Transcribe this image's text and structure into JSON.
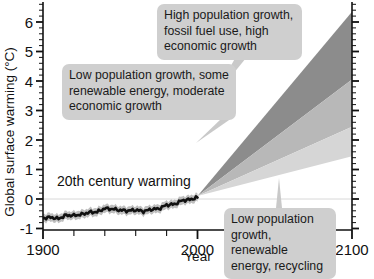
{
  "chart_data": {
    "type": "area",
    "title": "",
    "xlabel": "Year",
    "ylabel": "Global surface warming (°C)",
    "xlim": [
      1900,
      2100
    ],
    "ylim": [
      -1.2,
      6.6
    ],
    "xticks": [
      1900,
      2000,
      2100
    ],
    "xtick_labels": [
      "1900",
      "2000",
      "2100"
    ],
    "xminor_step": 20,
    "yticks": [
      -1,
      0,
      1,
      2,
      3,
      4,
      5,
      6
    ],
    "ytick_labels": [
      "-1",
      "0",
      "1",
      "2",
      "3",
      "4",
      "5",
      "6"
    ],
    "yminor_step": 0.2,
    "grid": false,
    "legend": "none",
    "zero_line": 0,
    "historical": {
      "name": "20th century warming",
      "x": [
        1900,
        1905,
        1910,
        1915,
        1920,
        1925,
        1930,
        1935,
        1940,
        1945,
        1950,
        1955,
        1960,
        1965,
        1970,
        1975,
        1980,
        1985,
        1990,
        1995,
        2000
      ],
      "y": [
        -0.65,
        -0.62,
        -0.67,
        -0.55,
        -0.56,
        -0.52,
        -0.45,
        -0.44,
        -0.32,
        -0.34,
        -0.38,
        -0.4,
        -0.37,
        -0.42,
        -0.35,
        -0.33,
        -0.2,
        -0.18,
        -0.05,
        -0.02,
        0.05
      ],
      "uncertainty": 0.14,
      "line_color": "#111111",
      "band_color": "#b4b4b4"
    },
    "scenarios": [
      {
        "name": "High population growth, fossil fuel use, high economic growth",
        "color": "#8c8c8c",
        "start_year": 2000,
        "start_value": 0.1,
        "end_year": 2100,
        "end_upper": 6.35,
        "end_lower": 4.05
      },
      {
        "name": "Low population growth, some renewable energy, moderate economic growth",
        "color": "#b8b8b8",
        "start_year": 2000,
        "start_value": 0.1,
        "end_year": 2100,
        "end_upper": 4.05,
        "end_lower": 2.45
      },
      {
        "name": "Low population growth, renewable energy, recycling",
        "color": "#d6d6d6",
        "start_year": 2000,
        "start_value": 0.1,
        "end_year": 2100,
        "end_upper": 2.45,
        "end_lower": 1.45
      }
    ]
  },
  "annotations": {
    "historical_label": "20th century warming",
    "callout_high": "High population growth, fossil fuel use, high economic growth",
    "callout_mid": "Low population growth, some renewable energy, moderate economic growth",
    "callout_low": "Low population growth, renewable energy, recycling"
  },
  "axes": {
    "y_title": "Global surface warming (°C)",
    "x_title": "Year",
    "x_start_label": "1900",
    "x_mid_label": "2000",
    "x_end_label": "2100",
    "y_labels": [
      "6",
      "5",
      "4",
      "3",
      "2",
      "1",
      "0",
      "-1"
    ]
  },
  "colors": {
    "background": "#ffffff",
    "axis": "#111111",
    "callout_bg": "#cfcfcf",
    "wedge_high": "#8c8c8c",
    "wedge_mid": "#b8b8b8",
    "wedge_low": "#d6d6d6",
    "history_line": "#111111",
    "history_band": "#b4b4b4"
  }
}
